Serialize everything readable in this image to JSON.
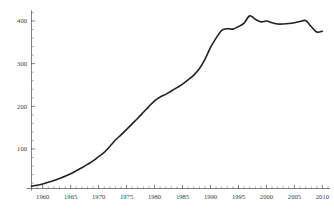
{
  "chart_data": {
    "type": "line",
    "title": "",
    "subtitle": "",
    "xlabel": "",
    "ylabel": "",
    "xlim": [
      1958,
      2011
    ],
    "ylim": [
      0,
      425
    ],
    "grid": false,
    "legend": false,
    "legend_position": "none",
    "x_ticks": [
      1960,
      1965,
      1970,
      1975,
      1980,
      1985,
      1990,
      1995,
      2000,
      2005,
      2010
    ],
    "x_tick_labels": [
      "1960",
      "1965",
      "1970",
      "1975",
      "1980",
      "1985",
      "1990",
      "1995",
      "2000",
      "2005",
      "2010"
    ],
    "x_minor_tick_step": 1,
    "y_ticks": [
      100,
      200,
      300,
      400
    ],
    "y_tick_labels": [
      "100",
      "200",
      "300",
      "400"
    ],
    "y_minor_tick_step": 20,
    "series": [
      {
        "name": "series-1",
        "color": "#222222",
        "x": [
          1958,
          1959,
          1960,
          1961,
          1962,
          1963,
          1964,
          1965,
          1966,
          1967,
          1968,
          1969,
          1970,
          1971,
          1972,
          1973,
          1974,
          1975,
          1976,
          1977,
          1978,
          1979,
          1980,
          1981,
          1982,
          1983,
          1984,
          1985,
          1986,
          1987,
          1988,
          1989,
          1990,
          1991,
          1992,
          1993,
          1994,
          1995,
          1996,
          1997,
          1998,
          1999,
          2000,
          2001,
          2002,
          2003,
          2004,
          2005,
          2006,
          2007,
          2008,
          2009,
          2010
        ],
        "y": [
          13,
          15,
          18,
          22,
          26,
          31,
          36,
          42,
          49,
          56,
          64,
          72,
          82,
          92,
          106,
          121,
          133,
          146,
          159,
          172,
          186,
          200,
          213,
          222,
          228,
          236,
          244,
          252,
          262,
          273,
          288,
          310,
          338,
          360,
          378,
          382,
          381,
          387,
          395,
          412,
          404,
          398,
          400,
          396,
          393,
          393,
          394,
          396,
          399,
          401,
          387,
          374,
          376
        ]
      }
    ]
  },
  "figure": {
    "background_color": "#ffffff",
    "axis_color": "#4a4a4a",
    "line_color": "#222222"
  }
}
